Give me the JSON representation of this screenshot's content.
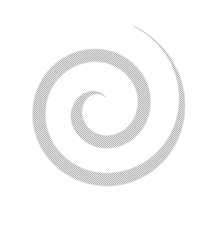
{
  "image": {
    "kind": "spiral-illustration",
    "title": "Spiral",
    "alt_text": "Grey halftone spiral",
    "width_px": 222,
    "height_px": 227,
    "background_color": "#ffffff",
    "stroke_color": "#b8b8b8",
    "stroke_color_light": "#d5d5d5",
    "stroke_color_dark": "#a8a8a8",
    "texture": "halftone-dither",
    "turns": 2,
    "center_x": 101,
    "center_y": 108,
    "inner_radius_px": 12,
    "outer_radius_px": 88,
    "max_stroke_width_px": 13,
    "min_stroke_width_px": 1,
    "tail_tip_x": 182,
    "tail_tip_y": 14,
    "inner_terminus_x": 99,
    "inner_terminus_y": 73,
    "winding": "counter-clockwise-outward"
  }
}
